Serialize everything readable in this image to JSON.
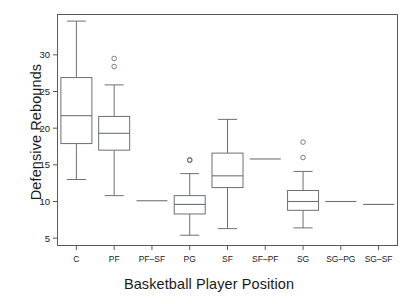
{
  "figure": {
    "clipped_top_text": "",
    "background_color": "#ffffff",
    "line_color": "#6b7075",
    "frame_color": "#555a5e",
    "text_color": "#1a1a1a"
  },
  "chart_data": {
    "type": "box",
    "title": "",
    "xlabel": "Basketball Player Position",
    "ylabel": "Defensive Rebounds",
    "categories": [
      "C",
      "PF",
      "PF-SF",
      "PG",
      "SF",
      "SF-PF",
      "SG",
      "SG-PG",
      "SG-SF"
    ],
    "ylim": [
      4.0,
      35.5
    ],
    "yticks": [
      5,
      10,
      15,
      20,
      25,
      30
    ],
    "ytick_labels": [
      "5",
      "10",
      "15",
      "20",
      "25",
      "30"
    ],
    "grid": false,
    "legend": null,
    "boxes": [
      {
        "category": "C",
        "whisker_low": 13.0,
        "q1": 17.9,
        "median": 21.7,
        "q3": 26.9,
        "whisker_high": 34.6,
        "outliers": [],
        "single_value": null
      },
      {
        "category": "PF",
        "whisker_low": 10.8,
        "q1": 17.0,
        "median": 19.3,
        "q3": 21.6,
        "whisker_high": 25.9,
        "outliers": [
          29.5,
          28.4
        ],
        "single_value": null
      },
      {
        "category": "PF-SF",
        "whisker_low": null,
        "q1": null,
        "median": 10.1,
        "q3": null,
        "whisker_high": null,
        "outliers": [],
        "single_value": 10.1
      },
      {
        "category": "PG",
        "whisker_low": 5.4,
        "q1": 8.3,
        "median": 9.6,
        "q3": 10.8,
        "whisker_high": 13.8,
        "outliers": [
          15.7,
          15.6
        ],
        "single_value": null
      },
      {
        "category": "SF",
        "whisker_low": 6.3,
        "q1": 11.9,
        "median": 13.5,
        "q3": 16.6,
        "whisker_high": 21.2,
        "outliers": [],
        "single_value": null
      },
      {
        "category": "SF-PF",
        "whisker_low": null,
        "q1": null,
        "median": 15.8,
        "q3": null,
        "whisker_high": null,
        "outliers": [],
        "single_value": 15.8
      },
      {
        "category": "SG",
        "whisker_low": 6.4,
        "q1": 8.8,
        "median": 10.0,
        "q3": 11.5,
        "whisker_high": 14.1,
        "outliers": [
          18.1,
          16.0
        ],
        "single_value": null
      },
      {
        "category": "SG-PG",
        "whisker_low": null,
        "q1": null,
        "median": 10.0,
        "q3": null,
        "whisker_high": null,
        "outliers": [],
        "single_value": 10.0
      },
      {
        "category": "SG-SF",
        "whisker_low": null,
        "q1": null,
        "median": 9.6,
        "q3": null,
        "whisker_high": null,
        "outliers": [],
        "single_value": 9.6
      }
    ]
  }
}
